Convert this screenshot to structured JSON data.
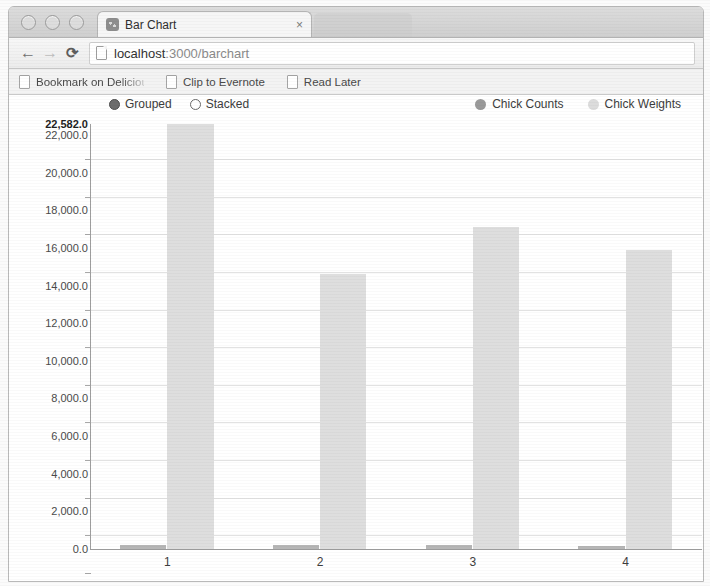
{
  "window": {
    "traffic_lights": [
      "close",
      "minimize",
      "zoom"
    ],
    "tab_title": "Bar Chart",
    "tab_close_label": "×"
  },
  "toolbar": {
    "back_label": "←",
    "forward_label": "→",
    "reload_label": "⟳",
    "url_host": "localhost",
    "url_rest": ":3000/barchart"
  },
  "bookmarks": [
    {
      "label": "Bookmark on Delicious",
      "truncated": true
    },
    {
      "label": "Clip to Evernote",
      "truncated": false
    },
    {
      "label": "Read Later",
      "truncated": false
    }
  ],
  "controls": {
    "radios": [
      {
        "label": "Grouped",
        "selected": true
      },
      {
        "label": "Stacked",
        "selected": false
      }
    ]
  },
  "colors": {
    "counts": "#b6b6b6",
    "weights": "#dedede",
    "axis": "#9e9e9e",
    "grid": "#e2e2e2"
  },
  "chart_data": {
    "type": "bar",
    "title": "",
    "xlabel": "",
    "ylabel": "",
    "categories": [
      "1",
      "2",
      "3",
      "4"
    ],
    "series": [
      {
        "name": "Chick Counts",
        "color": "#b6b6b6",
        "values": [
          220,
          200,
          190,
          170
        ]
      },
      {
        "name": "Chick Weights",
        "color": "#dedede",
        "values": [
          22582,
          14600,
          17100,
          15900
        ]
      }
    ],
    "ylim": [
      0,
      22582
    ],
    "yticks": [
      0,
      2000,
      4000,
      6000,
      8000,
      10000,
      12000,
      14000,
      16000,
      18000,
      20000,
      22000
    ],
    "ytick_labels": [
      "0.0",
      "2,000.0",
      "4,000.0",
      "6,000.0",
      "8,000.0",
      "10,000.0",
      "12,000.0",
      "14,000.0",
      "16,000.0",
      "18,000.0",
      "20,000.0",
      "22,000.0"
    ],
    "max_label": "22,582.0",
    "max_value": 22582,
    "grid": true,
    "grouped": true,
    "legend_position": "top-right",
    "legend": [
      "Chick Counts",
      "Chick Weights"
    ]
  }
}
